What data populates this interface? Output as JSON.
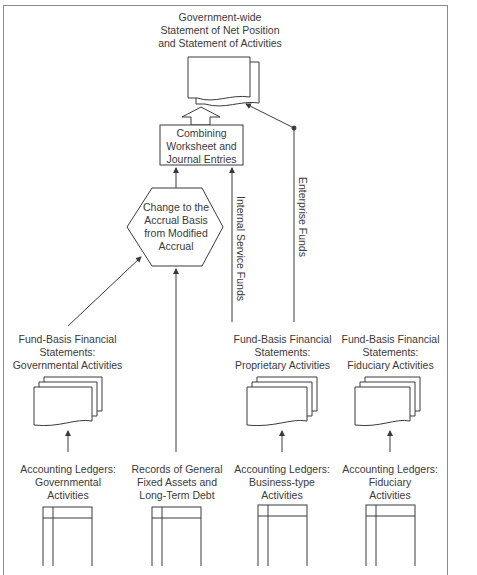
{
  "diagram": {
    "top_output": "Government-wide\nStatement of Net Position\nand Statement of Activities",
    "combining_box": "Combining\nWorksheet and\nJournal Entries",
    "conversion_hexagon": "Change to the\nAccrual Basis\nfrom Modified\nAccrual",
    "flow_labels": {
      "internal_service": "Internal Service Funds",
      "enterprise": "Enterprise Funds"
    },
    "fund_statements": [
      {
        "label": "Fund-Basis Financial\nStatements:\nGovernmental Activities"
      },
      {
        "label": "Fund-Basis Financial\nStatements:\nProprietary Activities"
      },
      {
        "label": "Fund-Basis Financial\nStatements:\nFiduciary Activities"
      }
    ],
    "ledgers": [
      {
        "label": "Accounting Ledgers:\nGovernmental\nActivities"
      },
      {
        "label": "Records of General\nFixed Assets and\nLong-Term Debt"
      },
      {
        "label": "Accounting Ledgers:\nBusiness-type\nActivities"
      },
      {
        "label": "Accounting Ledgers:\nFiduciary\nActivities"
      }
    ],
    "colors": {
      "line": "#3a3a3a",
      "frame": "#8a8a8a",
      "text": "#3a3a3a"
    }
  }
}
